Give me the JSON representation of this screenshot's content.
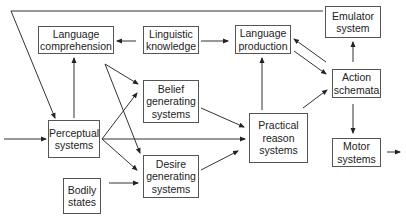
{
  "diagram": {
    "nodes": [
      {
        "id": "language_comprehension",
        "label": "Language\ncomprehension",
        "x": 38,
        "y": 26,
        "w": 76,
        "h": 28
      },
      {
        "id": "linguistic_knowledge",
        "label": "Linguistic\nknowledge",
        "x": 143,
        "y": 26,
        "w": 56,
        "h": 28
      },
      {
        "id": "language_production",
        "label": "Language\nproduction",
        "x": 235,
        "y": 25,
        "w": 56,
        "h": 29
      },
      {
        "id": "emulator_system",
        "label": "Emulator\nsystem",
        "x": 325,
        "y": 6,
        "w": 56,
        "h": 32
      },
      {
        "id": "belief_generating_systems",
        "label": "Belief\ngenerating\nsystems",
        "x": 143,
        "y": 80,
        "w": 56,
        "h": 43
      },
      {
        "id": "perceptual_systems",
        "label": "Perceptual\nsystems",
        "x": 48,
        "y": 120,
        "w": 52,
        "h": 38
      },
      {
        "id": "practical_reason_systems",
        "label": "Practical\nreason\nsystems",
        "x": 249,
        "y": 113,
        "w": 59,
        "h": 50
      },
      {
        "id": "action_schemata",
        "label": "Action\nschemata",
        "x": 332,
        "y": 69,
        "w": 49,
        "h": 29
      },
      {
        "id": "desire_generating_systems",
        "label": "Desire\ngenerating\nsystems",
        "x": 143,
        "y": 155,
        "w": 56,
        "h": 43
      },
      {
        "id": "bodily_states",
        "label": "Bodily\nstates",
        "x": 63,
        "y": 178,
        "w": 38,
        "h": 36
      },
      {
        "id": "motor_systems",
        "label": "Motor\nsystems",
        "x": 332,
        "y": 138,
        "w": 49,
        "h": 29
      }
    ],
    "edges": [
      {
        "from": "input",
        "to": "perceptual_systems",
        "points": [
          [
            4,
            139
          ],
          [
            46,
            139
          ]
        ],
        "arrow": true
      },
      {
        "from": "linguistic_knowledge",
        "to": "language_comprehension",
        "points": [
          [
            136,
            41
          ],
          [
            117,
            41
          ]
        ],
        "arrow": true
      },
      {
        "from": "linguistic_knowledge",
        "to": "language_production",
        "points": [
          [
            201,
            41
          ],
          [
            228,
            41
          ]
        ],
        "arrow": true
      },
      {
        "from": "perceptual_systems",
        "to": "language_comprehension",
        "points": [
          [
            74,
            118
          ],
          [
            74,
            58
          ]
        ],
        "arrow": true
      },
      {
        "from": "language_comprehension",
        "to": "belief_generating_systems",
        "points": [
          [
            105,
            64
          ],
          [
            138,
            84
          ]
        ],
        "arrow": true
      },
      {
        "from": "language_comprehension",
        "to": "desire_generating_systems",
        "points": [
          [
            105,
            64
          ],
          [
            140,
            153
          ]
        ],
        "arrow": true
      },
      {
        "from": "perceptual_systems",
        "to": "belief_generating_systems",
        "points": [
          [
            102,
            139
          ],
          [
            137,
            93
          ]
        ],
        "arrow": true
      },
      {
        "from": "perceptual_systems",
        "to": "desire_generating_systems",
        "points": [
          [
            102,
            139
          ],
          [
            137,
            170
          ]
        ],
        "arrow": true
      },
      {
        "from": "perceptual_systems",
        "to": "practical_reason_systems",
        "points": [
          [
            102,
            139
          ],
          [
            245,
            139
          ]
        ],
        "arrow": true
      },
      {
        "from": "belief_generating_systems",
        "to": "practical_reason_systems",
        "points": [
          [
            201,
            108
          ],
          [
            244,
            127
          ]
        ],
        "arrow": true
      },
      {
        "from": "desire_generating_systems",
        "to": "practical_reason_systems",
        "points": [
          [
            201,
            170
          ],
          [
            238,
            151
          ]
        ],
        "arrow": true
      },
      {
        "from": "bodily_states",
        "to": "desire_generating_systems",
        "points": [
          [
            109,
            183
          ],
          [
            138,
            183
          ]
        ],
        "arrow": true
      },
      {
        "from": "practical_reason_systems",
        "to": "language_production",
        "points": [
          [
            262,
            110
          ],
          [
            262,
            58
          ]
        ],
        "arrow": true
      },
      {
        "from": "practical_reason_systems",
        "to": "action_schemata",
        "points": [
          [
            303,
            108
          ],
          [
            327,
            90
          ]
        ],
        "arrow": true
      },
      {
        "from": "action_schemata",
        "to": "language_production",
        "points": [
          [
            326,
            62
          ],
          [
            294,
            39
          ]
        ],
        "arrow": true
      },
      {
        "from": "language_production",
        "to": "action_schemata",
        "points": [
          [
            294,
            51
          ],
          [
            326,
            74
          ]
        ],
        "arrow": true
      },
      {
        "from": "action_schemata",
        "to": "emulator_system",
        "points": [
          [
            353,
            62
          ],
          [
            353,
            42
          ]
        ],
        "arrow": true
      },
      {
        "from": "action_schemata",
        "to": "motor_systems",
        "points": [
          [
            353,
            104
          ],
          [
            353,
            133
          ]
        ],
        "arrow": true
      },
      {
        "from": "motor_systems",
        "to": "output",
        "points": [
          [
            387,
            152
          ],
          [
            400,
            152
          ]
        ],
        "arrow": true
      },
      {
        "from": "emulator_system",
        "to": "perceptual_systems",
        "points": [
          [
            323,
            11
          ],
          [
            11,
            11
          ],
          [
            55,
            118
          ]
        ],
        "arrow": true
      }
    ]
  }
}
